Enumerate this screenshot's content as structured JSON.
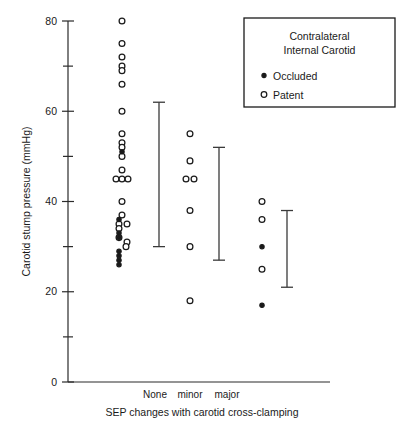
{
  "chart_data": {
    "type": "scatter",
    "title": "",
    "subtitle": "",
    "xlabel": "SEP changes with carotid cross-clamping",
    "ylabel": "Carotid stump pressure (mmHg)",
    "ylim": [
      0,
      80
    ],
    "grid": false,
    "categories": [
      "None",
      "minor",
      "major"
    ],
    "y_ticks_major": [
      0,
      20,
      40,
      60,
      80
    ],
    "y_ticks_minor": [
      10,
      30,
      50,
      70
    ],
    "y_tick_labels": [
      "0",
      "20",
      "40",
      "60",
      "80"
    ],
    "legend": {
      "position": "top-right",
      "title_line1": "Contralateral",
      "title_line2": "Internal Carotid",
      "entries": [
        {
          "label": "Occluded",
          "marker": "filled-circle"
        },
        {
          "label": "Patent",
          "marker": "open-circle"
        }
      ]
    },
    "series": [
      {
        "name": "Patent",
        "marker": "open-circle",
        "points": [
          {
            "category": "None",
            "value": 80,
            "offset": 0
          },
          {
            "category": "None",
            "value": 75,
            "offset": 0
          },
          {
            "category": "None",
            "value": 72,
            "offset": 0
          },
          {
            "category": "None",
            "value": 70,
            "offset": 0
          },
          {
            "category": "None",
            "value": 69,
            "offset": 0
          },
          {
            "category": "None",
            "value": 66,
            "offset": 0
          },
          {
            "category": "None",
            "value": 60,
            "offset": 0
          },
          {
            "category": "None",
            "value": 55,
            "offset": 0
          },
          {
            "category": "None",
            "value": 53,
            "offset": 0
          },
          {
            "category": "None",
            "value": 52,
            "offset": 0
          },
          {
            "category": "None",
            "value": 50,
            "offset": 0
          },
          {
            "category": "None",
            "value": 47,
            "offset": 0
          },
          {
            "category": "None",
            "value": 45,
            "offset": -6
          },
          {
            "category": "None",
            "value": 45,
            "offset": 0
          },
          {
            "category": "None",
            "value": 45,
            "offset": 6
          },
          {
            "category": "None",
            "value": 40,
            "offset": 0
          },
          {
            "category": "None",
            "value": 37,
            "offset": 0
          },
          {
            "category": "None",
            "value": 35,
            "offset": -3
          },
          {
            "category": "None",
            "value": 35,
            "offset": 5
          },
          {
            "category": "None",
            "value": 34,
            "offset": -3
          },
          {
            "category": "None",
            "value": 32,
            "offset": -3
          },
          {
            "category": "None",
            "value": 31,
            "offset": 5
          },
          {
            "category": "None",
            "value": 30,
            "offset": 4
          },
          {
            "category": "minor",
            "value": 55,
            "offset": 0
          },
          {
            "category": "minor",
            "value": 49,
            "offset": 0
          },
          {
            "category": "minor",
            "value": 45,
            "offset": -4
          },
          {
            "category": "minor",
            "value": 45,
            "offset": 4
          },
          {
            "category": "minor",
            "value": 38,
            "offset": 0
          },
          {
            "category": "minor",
            "value": 30,
            "offset": 0
          },
          {
            "category": "minor",
            "value": 18,
            "offset": 0
          },
          {
            "category": "major",
            "value": 40,
            "offset": 0
          },
          {
            "category": "major",
            "value": 36,
            "offset": 0
          },
          {
            "category": "major",
            "value": 25,
            "offset": 0
          }
        ]
      },
      {
        "name": "Occluded",
        "marker": "filled-circle",
        "points": [
          {
            "category": "None",
            "value": 51,
            "offset": 0
          },
          {
            "category": "None",
            "value": 36,
            "offset": -3
          },
          {
            "category": "None",
            "value": 33,
            "offset": -3
          },
          {
            "category": "None",
            "value": 32,
            "offset": -3
          },
          {
            "category": "None",
            "value": 29,
            "offset": -3
          },
          {
            "category": "None",
            "value": 28,
            "offset": -3
          },
          {
            "category": "None",
            "value": 27,
            "offset": -3
          },
          {
            "category": "None",
            "value": 26,
            "offset": -3
          },
          {
            "category": "major",
            "value": 30,
            "offset": 0
          },
          {
            "category": "major",
            "value": 17,
            "offset": 0
          }
        ]
      }
    ],
    "error_bars": [
      {
        "category": "None",
        "upper": 62,
        "lower": 30,
        "x_pixel": 159
      },
      {
        "category": "minor",
        "upper": 52,
        "lower": 27,
        "x_pixel": 219
      },
      {
        "category": "major",
        "upper": 38,
        "lower": 21,
        "x_pixel": 287
      }
    ]
  }
}
